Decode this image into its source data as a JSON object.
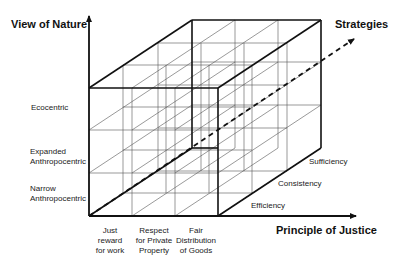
{
  "diagram": {
    "axes": {
      "y_title": "View of Nature",
      "x_title": "Principle of Justice",
      "z_title": "Strategies"
    },
    "y_categories": [
      {
        "line1": "Ecocentric",
        "line2": ""
      },
      {
        "line1": "Expanded",
        "line2": "Anthropocentric"
      },
      {
        "line1": "Narrow",
        "line2": "Anthropocentric"
      }
    ],
    "x_categories": [
      {
        "line1": "Just",
        "line2": "reward",
        "line3": "for work"
      },
      {
        "line1": "Respect",
        "line2": "for Private",
        "line3": "Property"
      },
      {
        "line1": "Fair",
        "line2": "Distribution",
        "line3": "of Goods"
      }
    ],
    "z_categories": [
      "Sufficiency",
      "Consistency",
      "Efficiency"
    ],
    "colors": {
      "line": "#111111",
      "grid": "#555555",
      "text": "#222222"
    }
  }
}
